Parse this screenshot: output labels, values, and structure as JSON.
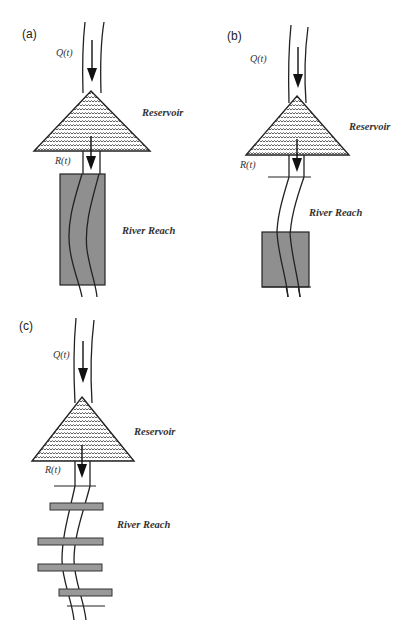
{
  "figure": {
    "panels": [
      {
        "id": "a",
        "label": "(a)",
        "inflow_label": "Q(t)",
        "reservoir_label": "Reservoir",
        "release_label": "R(t)",
        "reach_label": "River Reach",
        "reach_representation": "single long shaded block"
      },
      {
        "id": "b",
        "label": "(b)",
        "inflow_label": "Q(t)",
        "reservoir_label": "Reservoir",
        "release_label": "R(t)",
        "reach_label": "River Reach",
        "reach_representation": "cross-section line plus short shaded block downstream"
      },
      {
        "id": "c",
        "label": "(c)",
        "inflow_label": "Q(t)",
        "reservoir_label": "Reservoir",
        "release_label": "R(t)",
        "reach_label": "River Reach",
        "reach_representation": "multiple thin shaded segments between cross-section lines"
      }
    ],
    "colors": {
      "background": "#ffffff",
      "ink": "#222222",
      "shade": "#8f8f8f"
    }
  }
}
